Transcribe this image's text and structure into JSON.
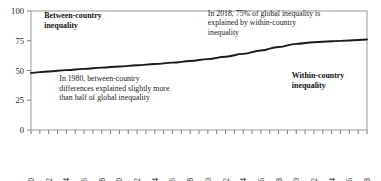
{
  "chart_data": {
    "type": "line",
    "title": "",
    "xlabel": "",
    "ylabel": "",
    "xlim": [
      1980,
      2018
    ],
    "ylim": [
      0,
      100
    ],
    "grid": false,
    "legend": "none",
    "y_ticks": [
      "0",
      "25",
      "50",
      "75",
      "100"
    ],
    "y_tick_values": [
      0,
      25,
      50,
      75,
      100
    ],
    "x_ticks": [
      "1980",
      "1982",
      "1984",
      "1986",
      "1988",
      "1990",
      "1992",
      "1994",
      "1996",
      "1998",
      "2000",
      "2002",
      "2004",
      "2006",
      "2008",
      "2010",
      "2012",
      "2014",
      "2016",
      "2018"
    ],
    "x_minor_tick_years": [
      1980,
      1981,
      1982,
      1983,
      1984,
      1985,
      1986,
      1987,
      1988,
      1989,
      1990,
      1991,
      1992,
      1993,
      1994,
      1995,
      1996,
      1997,
      1998,
      1999,
      2000,
      2001,
      2002,
      2003,
      2004,
      2005,
      2006,
      2007,
      2008,
      2009,
      2010,
      2011,
      2012,
      2013,
      2014,
      2015,
      2016,
      2017,
      2018
    ],
    "series": [
      {
        "name": "Between-country inequality share of global inequality",
        "color": "#1a1a1a",
        "x": [
          1980,
          1982,
          1984,
          1986,
          1988,
          1990,
          1992,
          1994,
          1996,
          1998,
          2000,
          2002,
          2004,
          2006,
          2008,
          2010,
          2012,
          2014,
          2016,
          2018
        ],
        "values": [
          48.0,
          49.2,
          50.3,
          51.4,
          52.4,
          53.4,
          54.4,
          55.4,
          56.6,
          58.0,
          59.6,
          61.6,
          64.0,
          66.8,
          69.8,
          72.4,
          73.8,
          74.6,
          75.2,
          76.0
        ]
      }
    ],
    "annotations": [
      {
        "name": "between-country-label",
        "lines": [
          "Between-country",
          "inequality"
        ],
        "style": "bold",
        "x": 1981.5,
        "y": 94
      },
      {
        "name": "within-country-label",
        "lines": [
          "Within-country",
          "inequality"
        ],
        "style": "bold",
        "x": 2009.5,
        "y": 44
      },
      {
        "name": "note-2018",
        "lines": [
          "In 2018, 75% of global inequality is",
          "explained by within-country",
          "inequality"
        ],
        "style": "regular",
        "x": 2000.0,
        "y": 96
      },
      {
        "name": "note-1980",
        "lines": [
          "In 1980, between-country",
          "differences explained slightly more",
          "than half of global inequality"
        ],
        "style": "regular",
        "x": 1983.2,
        "y": 41
      }
    ]
  },
  "colors": {
    "line": "#1a1a1a",
    "frame": "#9a9a9a",
    "tick": "#6e6e6e",
    "text": "#1b1b1b",
    "background": "#ffffff"
  }
}
